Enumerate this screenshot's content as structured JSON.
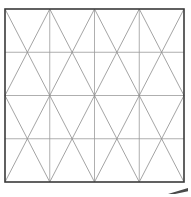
{
  "document": {
    "title": "Triangular lattice grid diagram",
    "width": 191,
    "height": 197,
    "background_color": "#ffffff"
  },
  "figure": {
    "name": "triangular-lattice-grid",
    "frame": {
      "x": 5,
      "y": 9,
      "width": 179,
      "height": 173,
      "stroke_color": "#3a3a3a",
      "stroke_width": 1.6
    },
    "grid": {
      "columns": 4,
      "rows": 4,
      "x_positions": [
        5,
        49.75,
        94.5,
        139.25,
        184
      ],
      "y_positions": [
        9,
        52.25,
        95.5,
        138.75,
        182
      ],
      "line_color": "#9a9a9a",
      "line_width": 0.8
    },
    "diagonals": {
      "pattern": "alternating-zigzag",
      "description": "Each grid cell contains two diagonals meeting at the mid-point of one horizontal edge; orientation alternates by row producing V shapes in odd rows and inverted V shapes in even rows.",
      "line_color": "#8d8d8d",
      "line_width": 0.8,
      "apex_x_positions": [
        27.375,
        72.125,
        116.875,
        161.625
      ]
    },
    "corner_mark": {
      "name": "bottom-right-scuff-mark",
      "x": 168,
      "y": 188,
      "width": 20,
      "height": 6,
      "color": "#4a4a4a",
      "description": "Small dark angled smudge outside the lower right corner of the frame."
    }
  },
  "chart_data": {
    "type": "table",
    "xlabel": "",
    "ylabel": "",
    "columns": [
      "row",
      "col",
      "cell_shape"
    ],
    "rows": [
      [
        1,
        1,
        "V"
      ],
      [
        1,
        2,
        "V"
      ],
      [
        1,
        3,
        "V"
      ],
      [
        1,
        4,
        "V"
      ],
      [
        2,
        1,
        "inverted-V"
      ],
      [
        2,
        2,
        "inverted-V"
      ],
      [
        2,
        3,
        "inverted-V"
      ],
      [
        2,
        4,
        "inverted-V"
      ],
      [
        3,
        1,
        "V"
      ],
      [
        3,
        2,
        "V"
      ],
      [
        3,
        3,
        "V"
      ],
      [
        3,
        4,
        "V"
      ],
      [
        4,
        1,
        "inverted-V"
      ],
      [
        4,
        2,
        "inverted-V"
      ],
      [
        4,
        3,
        "inverted-V"
      ],
      [
        4,
        4,
        "inverted-V"
      ]
    ],
    "categories": [
      "row 1",
      "row 2",
      "row 3",
      "row 4"
    ],
    "values": [
      4,
      4,
      4,
      4
    ],
    "legend": [],
    "grid": true
  }
}
